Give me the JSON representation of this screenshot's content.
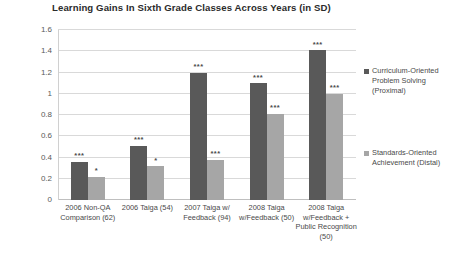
{
  "chart_data": {
    "type": "bar",
    "title": "Learning Gains In Sixth Grade Classes Across Years (in SD)",
    "xlabel": "",
    "ylabel": "",
    "ylim": [
      0,
      1.6
    ],
    "yticks": [
      "0",
      "0.2",
      "0.4",
      "0.6",
      "0.8",
      "1",
      "1.2",
      "1.4",
      "1.6"
    ],
    "ytick_values": [
      0,
      0.2,
      0.4,
      0.6,
      0.8,
      1,
      1.2,
      1.4,
      1.6
    ],
    "grid": true,
    "legend_position": "right",
    "categories": [
      "2006 Non-QA Comparison (62)",
      "2006 Taiga (54)",
      "2007 Taiga w/ Feedback (94)",
      "2008 Taiga w/Feedback (50)",
      "2008 Taiga w/Feedback + Public Recognition (50)"
    ],
    "series": [
      {
        "name": "Curriculum-Oriented Problem Solving (Proximal)",
        "color": "#595959",
        "values": [
          0.36,
          0.51,
          1.2,
          1.1,
          1.41
        ],
        "annotations": [
          "***",
          "***",
          "***",
          "***",
          "***"
        ]
      },
      {
        "name": "Standards-Oriented Achievement (Distal)",
        "color": "#a6a6a6",
        "values": [
          0.22,
          0.32,
          0.38,
          0.81,
          1.0
        ],
        "annotations": [
          "*",
          "*",
          "***",
          "***",
          "***"
        ]
      }
    ]
  },
  "legend": {
    "entries": [
      {
        "label_line1": "Curriculum-Oriented",
        "label_line2": "Problem Solving",
        "label_line3": "(Proximal)",
        "swatch": "proximal"
      },
      {
        "label_line1": "Standards-Oriented",
        "label_line2": "Achievement (Distal)",
        "label_line3": "",
        "swatch": "distal"
      }
    ]
  },
  "x_axis_labels": [
    [
      "2006 Non-QA",
      "Comparison (62)"
    ],
    [
      "2006 Taiga (54)"
    ],
    [
      "2007 Taiga w/",
      "Feedback (94)"
    ],
    [
      "2008 Taiga",
      "w/Feedback (50)"
    ],
    [
      "2008 Taiga",
      "w/Feedback +",
      "Public Recognition",
      "(50)"
    ]
  ]
}
